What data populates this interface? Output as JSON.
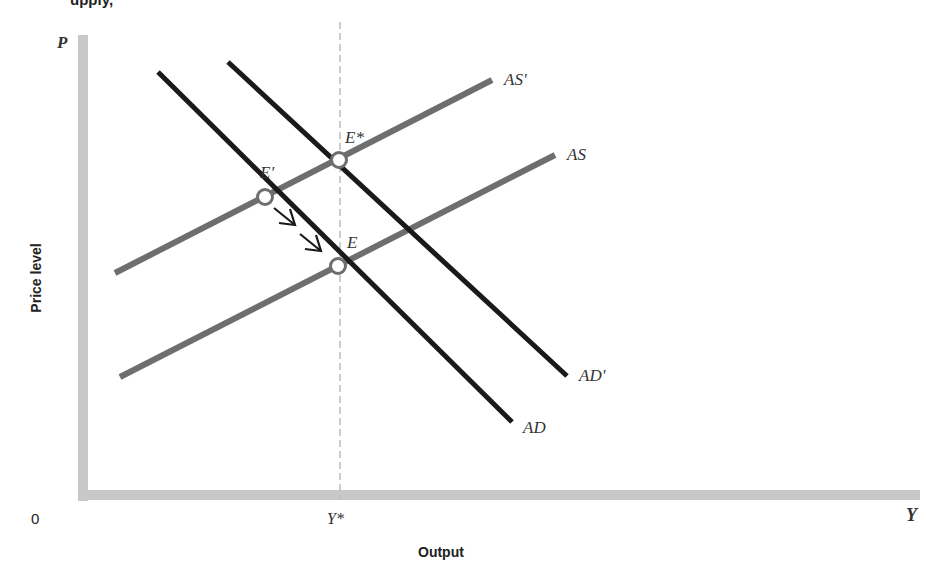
{
  "caption_fragment": "upply,",
  "axes": {
    "y_symbol": "P",
    "y_label": "Price level",
    "x_symbol": "Y",
    "x_label": "Output",
    "origin": "0",
    "x_tick": "Y*"
  },
  "curves": {
    "as": {
      "label": "AS",
      "color": "#6e6e6e"
    },
    "as_prime": {
      "label": "AS'",
      "color": "#6e6e6e"
    },
    "ad": {
      "label": "AD",
      "color": "#1a1a1a"
    },
    "ad_prime": {
      "label": "AD'",
      "color": "#1a1a1a"
    }
  },
  "points": {
    "e_prime": "E'",
    "e_star": "E*",
    "e": "E"
  },
  "colors": {
    "axis": "#c8c8c8",
    "supply": "#6e6e6e",
    "demand": "#1a1a1a",
    "dashed": "#bdbdbd"
  }
}
